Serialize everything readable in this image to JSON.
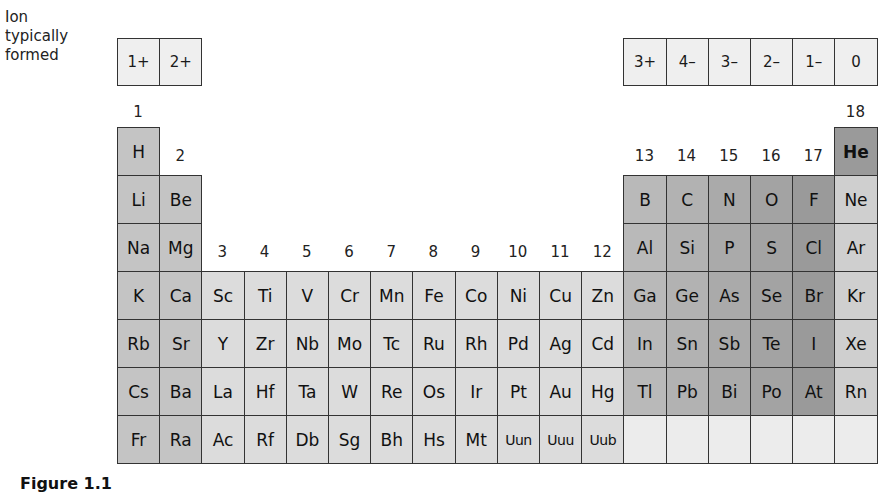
{
  "legend": {
    "line1": "Ion",
    "line2": "typically",
    "line3": "formed"
  },
  "ion_row": [
    {
      "col": 1,
      "label": "1+"
    },
    {
      "col": 2,
      "label": "2+"
    },
    {
      "col": 13,
      "label": "3+"
    },
    {
      "col": 14,
      "label": "4–"
    },
    {
      "col": 15,
      "label": "3–"
    },
    {
      "col": 16,
      "label": "2–"
    },
    {
      "col": 17,
      "label": "1–"
    },
    {
      "col": 18,
      "label": "0"
    }
  ],
  "group_labels": {
    "g1": "1",
    "g2": "2",
    "g3": "3",
    "g4": "4",
    "g5": "5",
    "g6": "6",
    "g7": "7",
    "g8": "8",
    "g9": "9",
    "g10": "10",
    "g11": "11",
    "g12": "12",
    "g13": "13",
    "g14": "14",
    "g15": "15",
    "g16": "16",
    "g17": "17",
    "g18": "18"
  },
  "colors": {
    "s_block": "#c4c4c4",
    "d_block": "#dcdcdc",
    "g13": "#b9b9b9",
    "g14": "#b2b2b2",
    "g15": "#aaaaaa",
    "g16": "#a3a3a3",
    "g17": "#9a9a9a",
    "g18": "#cfcfcf",
    "he": "#9a9a9a",
    "empty": "#ececec",
    "ion_box": "#efefef"
  },
  "elements": [
    [
      "H",
      null,
      null,
      null,
      null,
      null,
      null,
      null,
      null,
      null,
      null,
      null,
      null,
      null,
      null,
      null,
      null,
      "He"
    ],
    [
      "Li",
      "Be",
      null,
      null,
      null,
      null,
      null,
      null,
      null,
      null,
      null,
      null,
      "B",
      "C",
      "N",
      "O",
      "F",
      "Ne"
    ],
    [
      "Na",
      "Mg",
      null,
      null,
      null,
      null,
      null,
      null,
      null,
      null,
      null,
      null,
      "Al",
      "Si",
      "P",
      "S",
      "Cl",
      "Ar"
    ],
    [
      "K",
      "Ca",
      "Sc",
      "Ti",
      "V",
      "Cr",
      "Mn",
      "Fe",
      "Co",
      "Ni",
      "Cu",
      "Zn",
      "Ga",
      "Ge",
      "As",
      "Se",
      "Br",
      "Kr"
    ],
    [
      "Rb",
      "Sr",
      "Y",
      "Zr",
      "Nb",
      "Mo",
      "Tc",
      "Ru",
      "Rh",
      "Pd",
      "Ag",
      "Cd",
      "In",
      "Sn",
      "Sb",
      "Te",
      "I",
      "Xe"
    ],
    [
      "Cs",
      "Ba",
      "La",
      "Hf",
      "Ta",
      "W",
      "Re",
      "Os",
      "Ir",
      "Pt",
      "Au",
      "Hg",
      "Tl",
      "Pb",
      "Bi",
      "Po",
      "At",
      "Rn"
    ],
    [
      "Fr",
      "Ra",
      "Ac",
      "Rf",
      "Db",
      "Sg",
      "Bh",
      "Hs",
      "Mt",
      "Uun",
      "Uuu",
      "Uub",
      "",
      "",
      "",
      "",
      "",
      ""
    ]
  ],
  "caption": "Figure 1.1"
}
